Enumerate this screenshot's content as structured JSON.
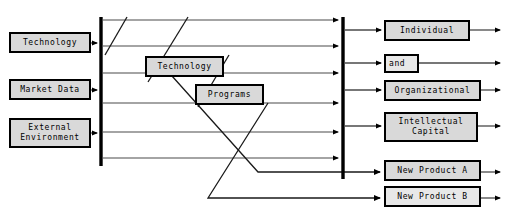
{
  "diagram": {
    "type": "process-flow-diagram",
    "colors": {
      "box_fill": "#d9d9d9",
      "box_fill_light": "#e8e8e8",
      "line": "#000000",
      "thin_line": "#555555",
      "background": "#ffffff"
    },
    "inputs": [
      {
        "id": "technology-input",
        "label": "Technology",
        "x": 10,
        "y": 33,
        "w": 80,
        "h": 19
      },
      {
        "id": "market-data-input",
        "label": "Market Data",
        "x": 10,
        "y": 80,
        "w": 80,
        "h": 19
      },
      {
        "id": "external-environment-input",
        "label": "External\nEnvironment",
        "x": 10,
        "y": 119,
        "w": 80,
        "h": 28
      }
    ],
    "middle_labels": [
      {
        "id": "technology-process",
        "label": "Technology",
        "x": 146,
        "y": 57,
        "w": 77,
        "h": 19
      },
      {
        "id": "programs-process",
        "label": "Programs",
        "x": 196,
        "y": 85,
        "w": 67,
        "h": 19
      }
    ],
    "outputs": [
      {
        "id": "individual-output",
        "label": "Individual",
        "x": 385,
        "y": 21,
        "w": 84,
        "h": 19
      },
      {
        "id": "and-output",
        "label": "and",
        "x": 385,
        "y": 55,
        "w": 33,
        "h": 17
      },
      {
        "id": "organizational-output",
        "label": "Organizational",
        "x": 385,
        "y": 81,
        "w": 95,
        "h": 19
      },
      {
        "id": "intellectual-capital-output",
        "label": "Intellectual\nCapital",
        "x": 385,
        "y": 113,
        "w": 92,
        "h": 28
      },
      {
        "id": "new-product-a-output",
        "label": "New Product A",
        "x": 385,
        "y": 161,
        "w": 95,
        "h": 19
      },
      {
        "id": "new-product-b-output",
        "label": "New Product B",
        "x": 385,
        "y": 187,
        "w": 95,
        "h": 19
      }
    ],
    "bars": [
      {
        "id": "left-sync-bar",
        "x": 100,
        "y1": 17,
        "y2": 166
      },
      {
        "id": "right-sync-bar",
        "x": 342,
        "y1": 17,
        "y2": 179
      }
    ],
    "flow_lines": [
      {
        "id": "flow-line-1",
        "y": 20
      },
      {
        "id": "flow-line-2",
        "y": 46
      },
      {
        "id": "flow-line-3",
        "y": 73
      },
      {
        "id": "flow-line-4",
        "y": 103
      },
      {
        "id": "flow-line-5",
        "y": 132
      },
      {
        "id": "flow-line-6",
        "y": 158
      }
    ],
    "diagonals": [
      {
        "id": "diagonal-1",
        "x1": 125,
        "y1": 17,
        "x2": 106,
        "y2": 50
      },
      {
        "id": "diagonal-2",
        "x1": 185,
        "y1": 17,
        "x2": 146,
        "y2": 76
      },
      {
        "id": "diagonal-3",
        "x1": 227,
        "y1": 57,
        "x2": 196,
        "y2": 105
      },
      {
        "id": "diagonal-4",
        "x1": 170,
        "y1": 76,
        "x2": 104,
        "y2": 172
      },
      {
        "id": "diagonal-5",
        "x1": 268,
        "y1": 105,
        "x2": 207,
        "y2": 198
      }
    ]
  }
}
